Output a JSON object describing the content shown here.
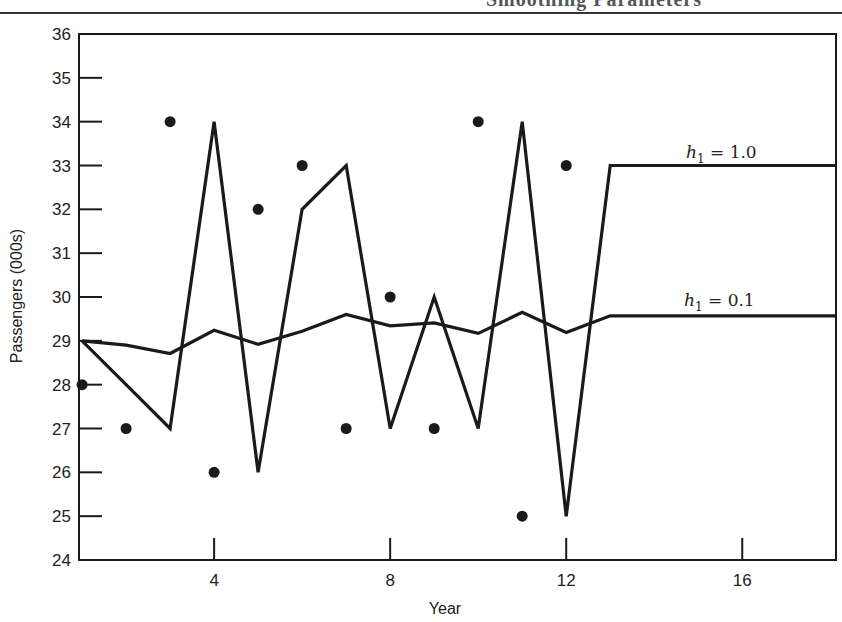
{
  "page": {
    "running_header": "Smoothing Parameters"
  },
  "chart_data": {
    "type": "line",
    "title": "",
    "xlabel": "Year",
    "ylabel": "Passengers (000s)",
    "xlim": [
      0.93,
      18.13
    ],
    "ylim": [
      24,
      36
    ],
    "x_ticks": [
      4,
      8,
      12,
      16
    ],
    "y_ticks": [
      24,
      25,
      26,
      27,
      28,
      29,
      30,
      31,
      32,
      33,
      34,
      35,
      36
    ],
    "grid": false,
    "legend": "inline labels at right",
    "actual": {
      "name": "Actual passengers",
      "marker": "dot",
      "x": [
        1,
        2,
        3,
        4,
        5,
        6,
        7,
        8,
        9,
        10,
        11,
        12
      ],
      "y": [
        28,
        27,
        34,
        26,
        32,
        33,
        27,
        30,
        27,
        34,
        25,
        33
      ]
    },
    "series": [
      {
        "name": "h1 = 1.0",
        "label_main": "h",
        "label_sub": "1",
        "label_rest": " = 1.0",
        "x": [
          1,
          2,
          3,
          4,
          5,
          6,
          7,
          8,
          9,
          10,
          11,
          12,
          13,
          18.13
        ],
        "y": [
          29,
          28,
          27,
          34,
          26,
          32,
          33,
          27,
          30,
          27,
          34,
          25,
          33,
          33
        ],
        "label_pos": [
          686,
          158
        ]
      },
      {
        "name": "h1 = 0.1",
        "label_main": "h",
        "label_sub": "1",
        "label_rest": " = 0.1",
        "x": [
          1,
          2,
          3,
          4,
          5,
          6,
          7,
          8,
          9,
          10,
          11,
          12,
          13,
          18.13
        ],
        "y": [
          29.0,
          28.9,
          28.71,
          29.24,
          28.92,
          29.22,
          29.6,
          29.34,
          29.41,
          29.17,
          29.65,
          29.19,
          29.57,
          29.57
        ],
        "label_pos": [
          684,
          306
        ]
      }
    ]
  },
  "plot_box": {
    "left": 79,
    "top": 34,
    "right": 836,
    "bottom": 560
  },
  "colors": {
    "ink": "#1a1a1a",
    "background": "#ffffff"
  }
}
